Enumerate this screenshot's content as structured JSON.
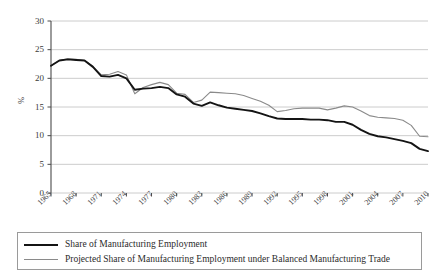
{
  "chart_data": {
    "type": "line",
    "title": "",
    "xlabel": "",
    "ylabel": "%",
    "ylim": [
      0,
      30
    ],
    "xlim": [
      1965,
      2010
    ],
    "yticks": [
      0,
      5,
      10,
      15,
      20,
      25,
      30
    ],
    "xticks": [
      1965,
      1968,
      1971,
      1974,
      1977,
      1980,
      1983,
      1986,
      1989,
      1992,
      1995,
      1998,
      2001,
      2004,
      2007,
      2010
    ],
    "grid": "horizontal",
    "legend_position": "below-plot",
    "x": [
      1965,
      1966,
      1967,
      1968,
      1969,
      1970,
      1971,
      1972,
      1973,
      1974,
      1975,
      1976,
      1977,
      1978,
      1979,
      1980,
      1981,
      1982,
      1983,
      1984,
      1985,
      1986,
      1987,
      1988,
      1989,
      1990,
      1991,
      1992,
      1993,
      1994,
      1995,
      1996,
      1997,
      1998,
      1999,
      2000,
      2001,
      2002,
      2003,
      2004,
      2005,
      2006,
      2007,
      2008,
      2009,
      2010
    ],
    "series": [
      {
        "name": "Share of Manufacturing Employment",
        "color": "#141414",
        "width": 1.9,
        "values": [
          22.2,
          23.1,
          23.3,
          23.2,
          23.1,
          22.0,
          20.4,
          20.3,
          20.6,
          20.0,
          18.0,
          18.2,
          18.3,
          18.5,
          18.3,
          17.2,
          16.8,
          15.6,
          15.2,
          15.8,
          15.3,
          14.9,
          14.7,
          14.5,
          14.3,
          13.9,
          13.4,
          13.0,
          12.9,
          12.9,
          12.9,
          12.8,
          12.8,
          12.7,
          12.4,
          12.4,
          11.9,
          11.0,
          10.3,
          9.9,
          9.7,
          9.4,
          9.1,
          8.7,
          7.7,
          7.3
        ]
      },
      {
        "name": "Projected Share of Manufacturing Employment under Balanced Manufacturing Trade",
        "color": "#8a8a8a",
        "width": 1.1,
        "values": [
          22.2,
          23.1,
          23.4,
          23.3,
          23.1,
          22.1,
          20.6,
          20.7,
          21.2,
          20.6,
          17.3,
          18.4,
          18.9,
          19.3,
          18.9,
          17.4,
          17.2,
          15.8,
          16.2,
          17.6,
          17.5,
          17.4,
          17.3,
          17.0,
          16.5,
          16.0,
          15.3,
          14.2,
          14.4,
          14.7,
          14.8,
          14.8,
          14.8,
          14.5,
          14.8,
          15.2,
          15.0,
          14.3,
          13.5,
          13.2,
          13.1,
          13.0,
          12.7,
          11.8,
          9.9,
          9.8
        ]
      }
    ]
  },
  "axis": {
    "y_label": "%",
    "y_ticks": [
      "0",
      "5",
      "10",
      "15",
      "20",
      "25",
      "30"
    ],
    "x_ticks": [
      "1965",
      "1968",
      "1971",
      "1974",
      "1977",
      "1980",
      "1983",
      "1986",
      "1989",
      "1992",
      "1995",
      "1998",
      "2001",
      "2004",
      "2007",
      "2010"
    ]
  },
  "legend": {
    "items": [
      {
        "label": "Share of Manufacturing Employment",
        "style": "black"
      },
      {
        "label": "Projected Share of Manufacturing Employment under Balanced Manufacturing Trade",
        "style": "gray"
      }
    ]
  },
  "colors": {
    "series_black": "#141414",
    "series_gray": "#8a8a8a",
    "gridline": "#c6c6c6",
    "axis": "#4a4a4a",
    "text": "#2b2b2b"
  }
}
